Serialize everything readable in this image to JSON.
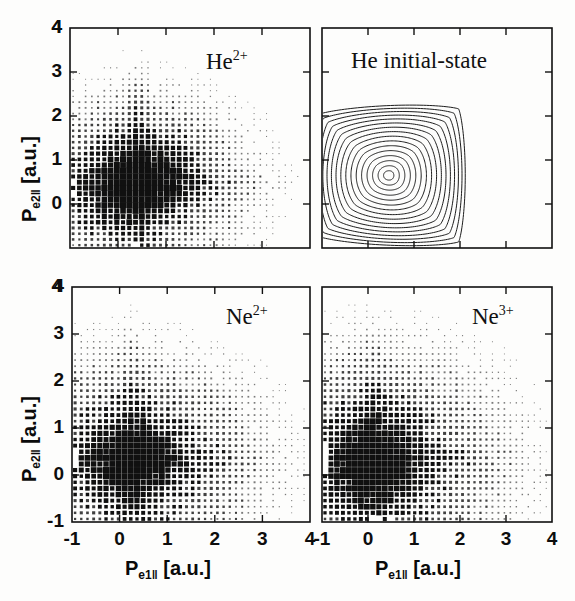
{
  "figure": {
    "width": 575,
    "height": 601,
    "background": "#fdfdfc",
    "ink_color": "#101010"
  },
  "axes_common": {
    "xlabel_main": "P",
    "xlabel_sub": "e1‖",
    "xlabel_unit": "[a.u.]",
    "ylabel_main": "P",
    "ylabel_sub": "e2‖",
    "ylabel_unit": "[a.u.]",
    "xticks": [
      -1,
      0,
      1,
      2,
      3,
      4
    ],
    "xticklabels": [
      "-1",
      "0",
      "1",
      "2",
      "3",
      "4"
    ],
    "yticks": [
      -1,
      0,
      1,
      2,
      3,
      4
    ],
    "yticklabels_top": [
      "",
      "0",
      "1",
      "2",
      "3",
      "4"
    ],
    "yticklabels_bottom": [
      "-1",
      "0",
      "1",
      "2",
      "3",
      "4"
    ],
    "xlim": [
      -1,
      4
    ],
    "ylim": [
      -1,
      4
    ]
  },
  "panels": [
    {
      "id": "he2plus",
      "title": "He",
      "title_sup": "2+",
      "position": "top-left",
      "type": "scatter-density"
    },
    {
      "id": "he-initial-state",
      "title": "He initial-state",
      "title_sup": "",
      "position": "top-right",
      "type": "contour"
    },
    {
      "id": "ne2plus",
      "title": "Ne",
      "title_sup": "2+",
      "position": "bottom-left",
      "type": "scatter-density"
    },
    {
      "id": "ne3plus",
      "title": "Ne",
      "title_sup": "3+",
      "position": "bottom-right",
      "type": "scatter-density"
    }
  ],
  "chart_data": [
    {
      "id": "he2plus",
      "type": "scatter",
      "title": "He2+",
      "xlabel": "P_e1|| [a.u.]",
      "ylabel": "P_e2|| [a.u.]",
      "xlim": [
        -1,
        4
      ],
      "ylim": [
        -1,
        4
      ],
      "grid": false,
      "marker": "square",
      "marker_size_encodes": "counts",
      "bin_step": 0.13,
      "peak": [
        0.35,
        0.45
      ],
      "gaussian_model": {
        "cx": 0.38,
        "cy": 0.48,
        "sx": 0.6,
        "sy": 0.55,
        "rho": 0.18,
        "tail_sx": 1.3,
        "tail_sy": 1.1,
        "tail_w": 0.3
      },
      "note": "Electron-electron longitudinal momentum correlation density; marker area proportional to yield."
    },
    {
      "id": "he-initial-state",
      "type": "contour",
      "title": "He initial-state",
      "xlabel": "P_e1|| [a.u.]",
      "ylabel": "P_e2|| [a.u.]",
      "xlim": [
        -1,
        4
      ],
      "ylim": [
        -1,
        4
      ],
      "grid": false,
      "center": [
        0.45,
        0.65
      ],
      "n_levels": 16,
      "shape": "rounded-diamond",
      "levels": [
        0.03,
        0.09,
        0.15,
        0.21,
        0.27,
        0.33,
        0.39,
        0.45,
        0.51,
        0.57,
        0.63,
        0.7,
        0.77,
        0.84,
        0.91,
        0.97
      ],
      "outer_half_diagonal_x": 2.15,
      "outer_half_diagonal_y": 2.05,
      "rotation_deg": 45,
      "note": "Compton-profile-like initial-state momentum distribution of He, concentric rounded-diamond contours."
    },
    {
      "id": "ne2plus",
      "type": "scatter",
      "title": "Ne2+",
      "xlabel": "P_e1|| [a.u.]",
      "ylabel": "P_e2|| [a.u.]",
      "xlim": [
        -1,
        4
      ],
      "ylim": [
        -1,
        4
      ],
      "grid": false,
      "marker": "square",
      "marker_size_encodes": "counts",
      "bin_step": 0.13,
      "peak": [
        0.25,
        0.3
      ],
      "gaussian_model": {
        "cx": 0.27,
        "cy": 0.33,
        "sx": 0.52,
        "sy": 0.5,
        "rho": 0.1,
        "tail_sx": 1.5,
        "tail_sy": 1.2,
        "tail_w": 0.33
      },
      "note": "Ne double ionization; strongly peaked near equal small momenta."
    },
    {
      "id": "ne3plus",
      "type": "scatter",
      "title": "Ne3+",
      "xlabel": "P_e1|| [a.u.]",
      "ylabel": "P_e2|| [a.u.]",
      "xlim": [
        -1,
        4
      ],
      "ylim": [
        -1,
        4
      ],
      "grid": false,
      "marker": "square",
      "marker_size_encodes": "counts",
      "bin_step": 0.13,
      "peak": [
        0.1,
        0.25
      ],
      "gaussian_model": {
        "cx": 0.12,
        "cy": 0.28,
        "sx": 0.55,
        "sy": 0.6,
        "rho": 0.05,
        "tail_sx": 1.6,
        "tail_sy": 1.3,
        "tail_w": 0.35
      },
      "note": "Ne triple ionization; broader, more symmetric cross-shaped distribution."
    }
  ]
}
